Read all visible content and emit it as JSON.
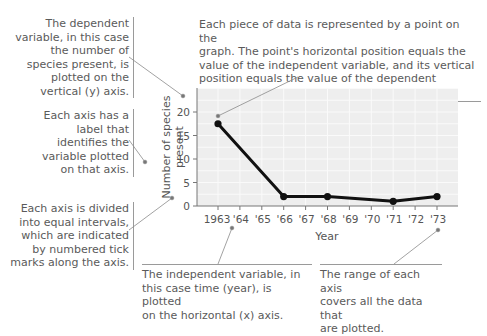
{
  "chart_data": {
    "type": "line",
    "title": "",
    "xlabel": "Year",
    "ylabel": "Number of species present",
    "x": [
      "1963",
      "'64",
      "'65",
      "'66",
      "'67",
      "'68",
      "'69",
      "'70",
      "'71",
      "'72",
      "'73"
    ],
    "series": [
      {
        "name": "Number of species present",
        "points": [
          {
            "x": "1963",
            "y": 17.5
          },
          {
            "x": "'66",
            "y": 2
          },
          {
            "x": "'68",
            "y": 2
          },
          {
            "x": "'71",
            "y": 1
          },
          {
            "x": "'73",
            "y": 2
          }
        ]
      }
    ],
    "yticks": [
      0,
      5,
      10,
      15,
      20
    ],
    "ylim": [
      0,
      25
    ],
    "grid": true,
    "legend": "none"
  },
  "annotations": {
    "dependent_variable": "The dependent variable, in this case the number of species present, is plotted on the vertical (y) axis.",
    "dependent_lines": [
      "The dependent",
      "variable, in this case",
      "the number of",
      "species present, is",
      "plotted on the",
      "vertical (y) axis."
    ],
    "axis_label_lines": [
      "Each axis has a",
      "label that",
      "identifies the",
      "variable plotted",
      "on that axis."
    ],
    "intervals_lines": [
      "Each axis is divided",
      "into equal intervals,",
      "which are indicated",
      "by numbered tick",
      "marks along the axis."
    ],
    "data_point_lines": [
      "Each piece of data is represented by a point on the",
      "graph. The point's horizontal position equals the",
      "value of the independent variable, and its vertical",
      "position equals the value of the dependent variable."
    ],
    "independent_lines": [
      "The independent variable, in",
      "this case time (year), is plotted",
      "on the horizontal (x) axis."
    ],
    "range_lines": [
      "The range of each axis",
      "covers all the data that",
      "are plotted."
    ]
  },
  "colors": {
    "plot_bg": "#eeeeee",
    "grid": "#fafafa",
    "line": "#111111",
    "leader": "#8a8a8a",
    "text": "#5a5a5a"
  }
}
